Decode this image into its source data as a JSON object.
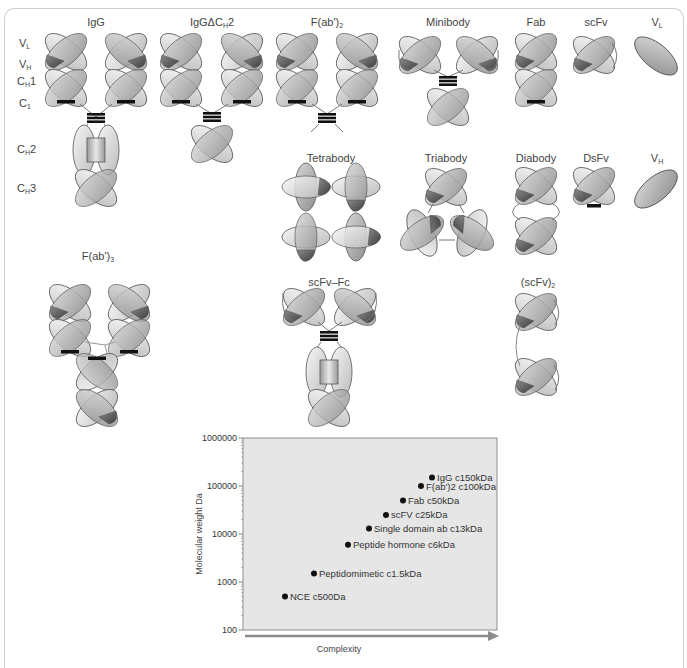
{
  "formats": {
    "igg": "IgG",
    "igg_dch2_pre": "IgGΔC",
    "igg_dch2_sub": "H",
    "igg_dch2_post": "2",
    "fab2_pre": "F(ab')",
    "fab2_sub": "2",
    "minibody": "Minibody",
    "fab": "Fab",
    "scfv": "scFv",
    "vl_pre": "V",
    "vl_sub": "L",
    "tetrabody": "Tetrabody",
    "triabody": "Triabody",
    "diabody": "Diabody",
    "dsfv": "DsFv",
    "vh_pre": "V",
    "vh_sub": "H",
    "fab3_pre": "F(ab')",
    "fab3_sub": "3",
    "scfv_fc": "scFv–Fc",
    "scfv2_pre": "(scFv)",
    "scfv2_sub": "2"
  },
  "domain_labels": [
    {
      "pre": "V",
      "sub": "L",
      "post": ""
    },
    {
      "pre": "V",
      "sub": "H",
      "post": ""
    },
    {
      "pre": "C",
      "sub": "H",
      "post": "1"
    },
    {
      "pre": "C",
      "sub": "1",
      "post": ""
    },
    {
      "pre": "C",
      "sub": "H",
      "post": "2"
    },
    {
      "pre": "C",
      "sub": "H",
      "post": "3"
    }
  ],
  "colors": {
    "light_domain": "#e4e4e4",
    "mid_domain": "#a9a9a9",
    "dark_domain": "#5a5a5a",
    "outline": "#555555",
    "chart_bg": "#e6e6e6",
    "axis_arrow": "#8c8c8c",
    "point": "#111111"
  },
  "chart_data": {
    "type": "scatter",
    "title": "",
    "xlabel": "Complexity",
    "ylabel": "Molecular weight Da",
    "yscale": "log",
    "ylim": [
      100,
      1000000
    ],
    "yticks": [
      "1000000",
      "100000",
      "10000",
      "1000",
      "100"
    ],
    "grid": false,
    "legend": "none",
    "points": [
      {
        "label": "NCE c500Da",
        "complexity_rank": 1,
        "y": 500
      },
      {
        "label": "Peptidomimetic c1.5kDa",
        "complexity_rank": 2,
        "y": 1500
      },
      {
        "label": "Peptide hormone c6kDa",
        "complexity_rank": 3,
        "y": 6000
      },
      {
        "label": "Single domain ab c13kDa",
        "complexity_rank": 4,
        "y": 13000
      },
      {
        "label": "scFV c25kDa",
        "complexity_rank": 5,
        "y": 25000
      },
      {
        "label": "Fab c50kDa",
        "complexity_rank": 6,
        "y": 50000
      },
      {
        "label": "F(ab')2 c100kDa",
        "complexity_rank": 7,
        "y": 100000
      },
      {
        "label": "IgG c150kDa",
        "complexity_rank": 8,
        "y": 150000
      }
    ]
  }
}
